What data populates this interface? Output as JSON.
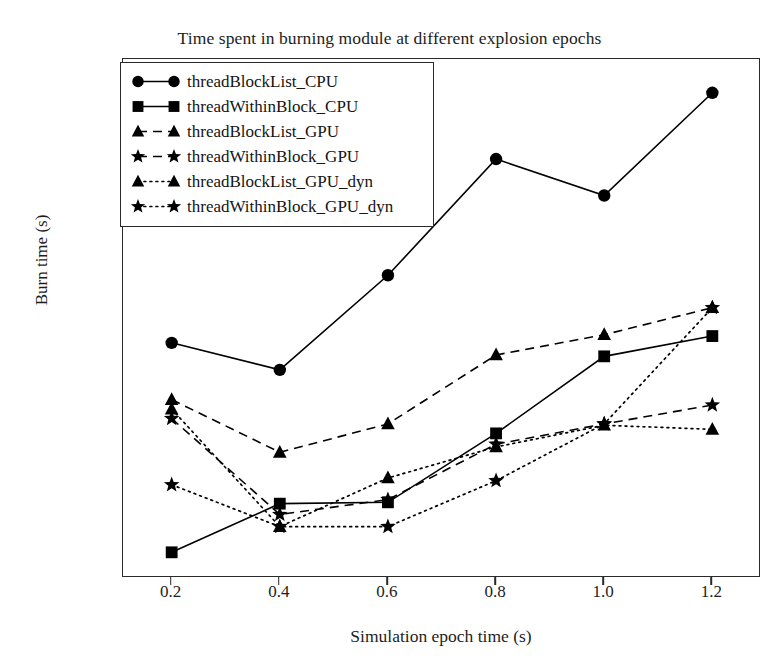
{
  "chart_data": {
    "type": "line",
    "title": "Time spent in burning module at different explosion epochs",
    "xlabel": "Simulation epoch time (s)",
    "ylabel": "Burn time (s)",
    "x": [
      0.2,
      0.4,
      0.6,
      0.8,
      1.0,
      1.2
    ],
    "xticks": [
      "0.2",
      "0.4",
      "0.6",
      "0.8",
      "1.0",
      "1.2"
    ],
    "yticks": [
      "500",
      "1000",
      "1500",
      "2000"
    ],
    "ytick_values": [
      500,
      1000,
      1500,
      2000
    ],
    "xlim": [
      0.11,
      1.29
    ],
    "ylim": [
      240,
      2160
    ],
    "grid": false,
    "legend_position": "upper left",
    "series": [
      {
        "name": "threadBlockList_CPU",
        "marker": "circle",
        "linestyle": "solid",
        "color": "#000000",
        "values": [
          1110,
          1010,
          1360,
          1790,
          1655,
          2035
        ]
      },
      {
        "name": "threadWithinBlock_CPU",
        "marker": "square",
        "linestyle": "solid",
        "color": "#000000",
        "values": [
          335,
          515,
          520,
          775,
          1060,
          1135
        ]
      },
      {
        "name": "threadBlockList_GPU",
        "marker": "triangle",
        "linestyle": "dashed",
        "color": "#000000",
        "values": [
          900,
          705,
          810,
          1065,
          1140,
          1240
        ]
      },
      {
        "name": "threadWithinBlock_GPU",
        "marker": "star",
        "linestyle": "dashed",
        "color": "#000000",
        "values": [
          830,
          475,
          530,
          735,
          810,
          880
        ]
      },
      {
        "name": "threadBlockList_GPU_dyn",
        "marker": "triangle",
        "linestyle": "dotted",
        "color": "#000000",
        "values": [
          865,
          430,
          610,
          725,
          805,
          790
        ]
      },
      {
        "name": "threadWithinBlock_GPU_dyn",
        "marker": "star",
        "linestyle": "dotted",
        "color": "#000000",
        "values": [
          585,
          430,
          430,
          600,
          810,
          1240
        ]
      }
    ]
  },
  "legend": {
    "entries": [
      {
        "label": "threadBlockList_CPU"
      },
      {
        "label": "threadWithinBlock_CPU"
      },
      {
        "label": "threadBlockList_GPU"
      },
      {
        "label": "threadWithinBlock_GPU"
      },
      {
        "label": "threadBlockList_GPU_dyn"
      },
      {
        "label": "threadWithinBlock_GPU_dyn"
      }
    ]
  }
}
